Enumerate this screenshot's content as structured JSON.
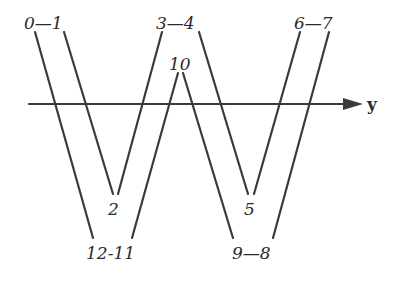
{
  "diagram": {
    "type": "W-shaped path diagram crossing a horizontal axis",
    "axis": {
      "label": "y",
      "y": 104,
      "x_start": 29,
      "x_end": 345,
      "arrow_tip": 362,
      "color": "#3a3a3a"
    },
    "labels": {
      "top_left": "0—1",
      "top_middle": "3—4",
      "top_right": "6—7",
      "peak_middle": "10",
      "valley_left_inner": "2",
      "valley_right_inner": "5",
      "bottom_left": "12-11",
      "bottom_right": "9—8"
    },
    "segments": [
      {
        "from": "0",
        "to": "12",
        "x1": 35,
        "y1": 32,
        "x2": 93,
        "y2": 238
      },
      {
        "from": "1",
        "to": "2",
        "x1": 64,
        "y1": 32,
        "x2": 113,
        "y2": 194
      },
      {
        "from": "2",
        "to": "3",
        "x1": 118,
        "y1": 194,
        "x2": 162,
        "y2": 32
      },
      {
        "from": "10",
        "to": "11",
        "x1": 178,
        "y1": 73,
        "x2": 132,
        "y2": 238
      },
      {
        "from": "10",
        "to": "9",
        "x1": 183,
        "y1": 73,
        "x2": 233,
        "y2": 238
      },
      {
        "from": "4",
        "to": "5",
        "x1": 199,
        "y1": 32,
        "x2": 248,
        "y2": 194
      },
      {
        "from": "5",
        "to": "6",
        "x1": 254,
        "y1": 194,
        "x2": 300,
        "y2": 32
      },
      {
        "from": "7",
        "to": "8",
        "x1": 329,
        "y1": 32,
        "x2": 273,
        "y2": 238
      }
    ],
    "line_color": "#3a3a3a",
    "text_color": "#2a2a2a"
  }
}
